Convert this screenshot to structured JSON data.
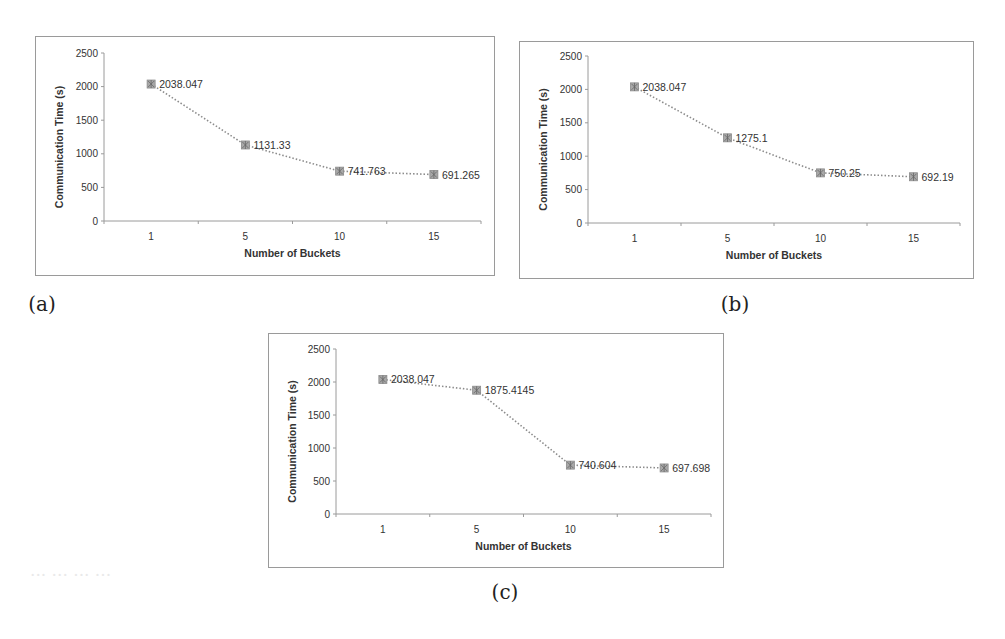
{
  "figure": {
    "captions": [
      "(a)",
      "(b)",
      "(c)"
    ]
  },
  "chart_data": [
    {
      "type": "line",
      "panel": "(a)",
      "title": "",
      "xlabel": "Number of Buckets",
      "ylabel": "Communication Time (s)",
      "categories": [
        "1",
        "5",
        "10",
        "15"
      ],
      "values": [
        2038.047,
        1131.33,
        741.763,
        691.265
      ],
      "data_labels": [
        "2038.047",
        "1131.33",
        "741.763",
        "691.265"
      ],
      "y_ticks": [
        "0",
        "500",
        "1000",
        "1500",
        "2000",
        "2500"
      ],
      "ylim": [
        0,
        2500
      ],
      "grid": false,
      "legend": "none",
      "line_style": "dotted",
      "marker": "square-star",
      "color": "#8c8c8c"
    },
    {
      "type": "line",
      "panel": "(b)",
      "title": "",
      "xlabel": "Number of Buckets",
      "ylabel": "Communication Time (s)",
      "categories": [
        "1",
        "5",
        "10",
        "15"
      ],
      "values": [
        2038.047,
        1275.1,
        750.25,
        692.19
      ],
      "data_labels": [
        "2038.047",
        "1275.1",
        "750.25",
        "692.19"
      ],
      "y_ticks": [
        "0",
        "500",
        "1000",
        "1500",
        "2000",
        "2500"
      ],
      "ylim": [
        0,
        2500
      ],
      "grid": false,
      "legend": "none",
      "line_style": "dotted",
      "marker": "square-star",
      "color": "#8c8c8c"
    },
    {
      "type": "line",
      "panel": "(c)",
      "title": "",
      "xlabel": "Number of Buckets",
      "ylabel": "Communication Time (s)",
      "categories": [
        "1",
        "5",
        "10",
        "15"
      ],
      "values": [
        2038.047,
        1875.4145,
        740.604,
        697.698
      ],
      "data_labels": [
        "2038.047",
        "1875.4145",
        "740.604",
        "697.698"
      ],
      "y_ticks": [
        "0",
        "500",
        "1000",
        "1500",
        "2000",
        "2500"
      ],
      "ylim": [
        0,
        2500
      ],
      "grid": false,
      "legend": "none",
      "line_style": "dotted",
      "marker": "square-star",
      "color": "#8c8c8c"
    }
  ]
}
